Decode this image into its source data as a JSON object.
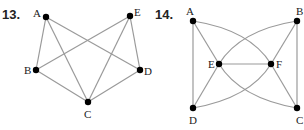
{
  "graphs": [
    {
      "number": "13.",
      "vertices": {
        "A": {
          "label": "A",
          "x": 46,
          "y": 17
        },
        "E": {
          "label": "E",
          "x": 130,
          "y": 16
        },
        "B": {
          "label": "B",
          "x": 36,
          "y": 70
        },
        "D": {
          "label": "D",
          "x": 140,
          "y": 70
        },
        "C": {
          "label": "C",
          "x": 88,
          "y": 102
        }
      },
      "edges": [
        [
          "A",
          "B"
        ],
        [
          "A",
          "C"
        ],
        [
          "A",
          "D"
        ],
        [
          "E",
          "B"
        ],
        [
          "E",
          "C"
        ],
        [
          "E",
          "D"
        ],
        [
          "B",
          "C"
        ],
        [
          "C",
          "D"
        ]
      ]
    },
    {
      "number": "14.",
      "vertices": {
        "A": {
          "label": "A",
          "x": 193,
          "y": 21
        },
        "B": {
          "label": "B",
          "x": 297,
          "y": 21
        },
        "E": {
          "label": "E",
          "x": 219,
          "y": 64
        },
        "F": {
          "label": "F",
          "x": 271,
          "y": 64
        },
        "D": {
          "label": "D",
          "x": 193,
          "y": 108
        },
        "C": {
          "label": "C",
          "x": 297,
          "y": 108
        }
      },
      "edges": [
        [
          "A",
          "D"
        ],
        [
          "B",
          "C"
        ],
        [
          "A",
          "E"
        ],
        [
          "E",
          "D"
        ],
        [
          "B",
          "F"
        ],
        [
          "F",
          "C"
        ],
        [
          "E",
          "F"
        ]
      ],
      "curved_edges": [
        [
          "A",
          "F"
        ],
        [
          "B",
          "E"
        ],
        [
          "E",
          "C"
        ],
        [
          "D",
          "F"
        ]
      ]
    }
  ]
}
